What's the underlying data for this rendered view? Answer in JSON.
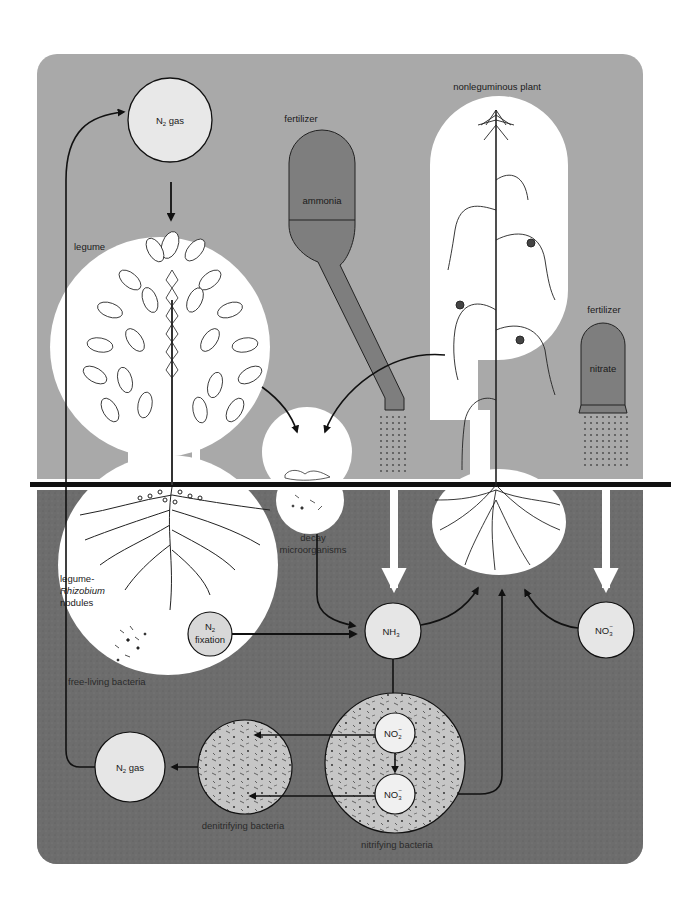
{
  "colors": {
    "sky": "#a9a9a9",
    "soil": "#6f6f6f",
    "white_region": "#ffffff",
    "node_fill": "#e6e6e6",
    "fertilizer_tank": "#7e7e7e",
    "ground_line": "#111111",
    "arrow": "#111111",
    "bacteria_fill": "#c4c4c4"
  },
  "labels": {
    "nonleguminous_plant": "nonleguminous plant",
    "fertilizer_ammonia_title": "fertilizer",
    "ammonia": "ammonia",
    "fertilizer_nitrate_title": "fertilizer",
    "nitrate": "nitrate",
    "legume": "legume",
    "decay_line1": "decay",
    "decay_line2": "microorganisms",
    "rhizobium_line1": "legume-",
    "rhizobium_line2": "Rhizobium",
    "rhizobium_line3": "nodules",
    "free_living": "free-living bacteria",
    "denitrifying": "denitrifying bacteria",
    "nitrifying": "nitrifying bacteria"
  },
  "nodes": {
    "n2_gas_top": {
      "main": "N",
      "sub": "2",
      "rest": " gas"
    },
    "n2_fixation": {
      "main": "N",
      "sub": "2",
      "line2": "fixation"
    },
    "nh3": {
      "main": "NH",
      "sub": "3"
    },
    "no3_right": {
      "main": "NO",
      "sub": "3",
      "sup": "−"
    },
    "no2_nitrifying": {
      "main": "NO",
      "sub": "2",
      "sup": "−"
    },
    "no3_nitrifying": {
      "main": "NO",
      "sub": "3",
      "sup": "−"
    },
    "n2_gas_bottom": {
      "main": "N",
      "sub": "2",
      "rest": " gas"
    }
  },
  "flows": [
    {
      "from": "N2 gas",
      "to": "legume"
    },
    {
      "from": "legume",
      "to": "decay microorganisms"
    },
    {
      "from": "nonleguminous plant",
      "to": "decay microorganisms"
    },
    {
      "from": "decay microorganisms",
      "to": "NH3"
    },
    {
      "from": "N2 fixation",
      "to": "NH3"
    },
    {
      "from": "fertilizer ammonia",
      "to": "NH3"
    },
    {
      "from": "NH3",
      "to": "nonleguminous plant"
    },
    {
      "from": "NH3",
      "to": "NO2-"
    },
    {
      "from": "NO2-",
      "to": "NO3-"
    },
    {
      "from": "NO3- (nitrifying)",
      "to": "nonleguminous plant"
    },
    {
      "from": "fertilizer nitrate",
      "to": "NO3-"
    },
    {
      "from": "NO3-",
      "to": "nonleguminous plant"
    },
    {
      "from": "NO2-",
      "to": "denitrifying bacteria"
    },
    {
      "from": "NO3-",
      "to": "denitrifying bacteria"
    },
    {
      "from": "denitrifying bacteria",
      "to": "N2 gas"
    },
    {
      "from": "N2 gas (bottom)",
      "to": "N2 gas (top)"
    }
  ]
}
